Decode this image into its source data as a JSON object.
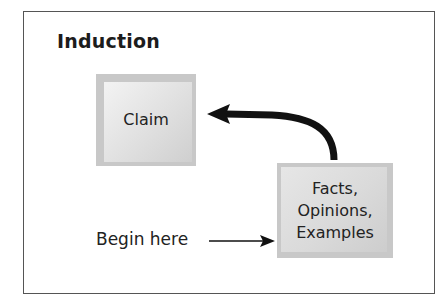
{
  "diagram": {
    "title": "Induction",
    "nodes": [
      {
        "id": "claim",
        "label": "Claim"
      },
      {
        "id": "evidence",
        "label_lines": [
          "Facts,",
          "Opinions,",
          "Examples"
        ]
      }
    ],
    "edges": [
      {
        "from": "evidence",
        "to": "claim",
        "style": "thick-curved-arrow"
      },
      {
        "from": "begin",
        "to": "evidence",
        "style": "thin-arrow"
      }
    ],
    "start_label": "Begin here",
    "colors": {
      "frame": "#555555",
      "box_shade": "#c8c8c8",
      "box_highlight": "#f3f3f3",
      "arrow": "#111111",
      "text": "#222222"
    }
  }
}
